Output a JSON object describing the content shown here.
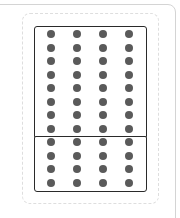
{
  "diagram": {
    "columns": 4,
    "top_group": {
      "rows": 8,
      "columns": 4,
      "total": 32
    },
    "bottom_group": {
      "rows": 4,
      "columns": 4,
      "total": 16
    },
    "total_dots": 48,
    "colors": {
      "dot": "#5a5a5a",
      "box_border": "#2a2a2a",
      "dashed_border": "#dedede",
      "card_border": "#d4d4d4"
    },
    "layout": {
      "col_x": [
        47,
        73,
        99,
        125
      ],
      "top_row_y": [
        30,
        43.5,
        57,
        70.5,
        84,
        97.5,
        111,
        124.5
      ],
      "bottom_row_y": [
        138,
        151.5,
        165,
        178.5
      ]
    }
  }
}
